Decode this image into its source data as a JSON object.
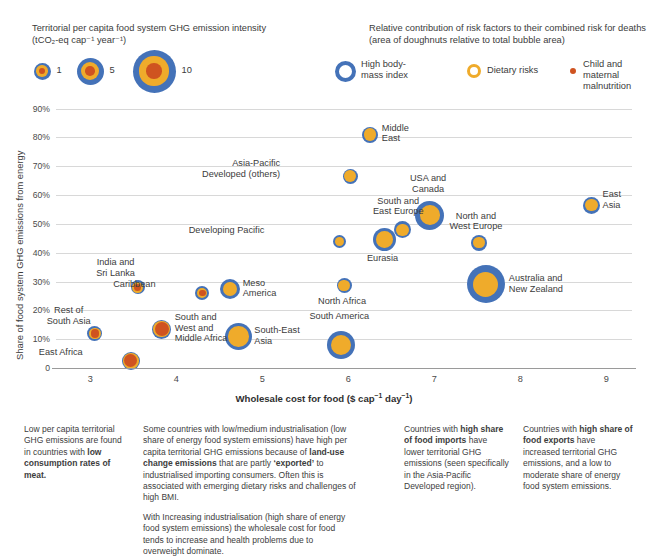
{
  "size_legend": {
    "title_line1": "Territorial per capita food system GHG emission intensity",
    "title_line2": "(tCO₂-eq cap⁻¹ year⁻¹)",
    "items": [
      {
        "label": "1",
        "value": 1
      },
      {
        "label": "5",
        "value": 5
      },
      {
        "label": "10",
        "value": 10
      }
    ]
  },
  "risk_legend": {
    "title_line1": "Relative contribution of risk factors to their combined risk for deaths",
    "title_line2": "(area of doughnuts relative to total bubble area)",
    "items": [
      {
        "label": "High body-mass index",
        "color": "#4472b8"
      },
      {
        "label": "Dietary risks",
        "color": "#efab2b"
      },
      {
        "label": "Child and maternal malnutrition",
        "color": "#cf5320"
      }
    ]
  },
  "chart_data": {
    "type": "scatter",
    "title": "",
    "xlabel": "Wholesale cost for food ($ cap⁻¹ day⁻¹)",
    "ylabel": "Share of food system GHG emissions from energy",
    "xlim": [
      2.6,
      9.3
    ],
    "ylim": [
      0,
      93
    ],
    "xticks": [
      "3",
      "4",
      "5",
      "6",
      "7",
      "8",
      "9"
    ],
    "xtick_values": [
      3,
      4,
      5,
      6,
      7,
      8,
      9
    ],
    "yticks": [
      "0",
      "10%",
      "20%",
      "30%",
      "40%",
      "50%",
      "60%",
      "70%",
      "80%",
      "90%"
    ],
    "ytick_values": [
      0,
      10,
      20,
      30,
      40,
      50,
      60,
      70,
      80,
      90
    ],
    "grid": true,
    "legend_position": "top",
    "colors": {
      "bmi": "#4472b8",
      "dietary": "#efab2b",
      "malnutrition": "#cf5320"
    },
    "points": [
      {
        "name": "Rest of\nSouth Asia",
        "x": 3.05,
        "y": 12.0,
        "r": 7.5,
        "dietary": 0.62,
        "malnutrition": 0.3,
        "label_dx": -26,
        "label_dy": -28,
        "label_align": "center"
      },
      {
        "name": "East Africa",
        "x": 3.47,
        "y": 2.5,
        "r": 9.0,
        "dietary": 0.74,
        "malnutrition": 0.52,
        "label_dx": -48,
        "label_dy": -14,
        "label_align": "right"
      },
      {
        "name": "India and\nSri Lanka",
        "x": 3.55,
        "y": 28.0,
        "r": 7.0,
        "dietary": 0.6,
        "malnutrition": 0.26,
        "label_dx": -22,
        "label_dy": -30,
        "label_align": "center"
      },
      {
        "name": "South and\nWest and\nMiddle Africa",
        "x": 3.83,
        "y": 13.5,
        "r": 9.5,
        "dietary": 0.76,
        "malnutrition": 0.56,
        "label_dx": 13,
        "label_dy": -17,
        "label_align": "left"
      },
      {
        "name": "Caribbean",
        "x": 4.3,
        "y": 26.0,
        "r": 7.0,
        "dietary": 0.58,
        "malnutrition": 0.24,
        "label_dx": -47,
        "label_dy": -14,
        "label_align": "right"
      },
      {
        "name": "Meso\nAmerica",
        "x": 4.62,
        "y": 27.5,
        "r": 10.0,
        "dietary": 0.5,
        "malnutrition": 0.0,
        "label_dx": 13,
        "label_dy": -11,
        "label_align": "left"
      },
      {
        "name": "South-East\nAsia",
        "x": 4.72,
        "y": 11.0,
        "r": 13.5,
        "dietary": 0.58,
        "malnutrition": 0.0,
        "label_dx": 16,
        "label_dy": -11,
        "label_align": "left"
      },
      {
        "name": "South America",
        "x": 5.92,
        "y": 8.0,
        "r": 14.0,
        "dietary": 0.52,
        "malnutrition": 0.0,
        "label_dx": -2,
        "label_dy": -34,
        "label_align": "center"
      },
      {
        "name": "North Africa",
        "x": 5.95,
        "y": 28.5,
        "r": 7.5,
        "dietary": 0.55,
        "malnutrition": 0.0,
        "label_dx": -2,
        "label_dy": 10,
        "label_align": "center"
      },
      {
        "name": "Developing Pacific",
        "x": 5.9,
        "y": 44.0,
        "r": 6.5,
        "dietary": 0.48,
        "malnutrition": 0.0,
        "label_dx": -75,
        "label_dy": -16,
        "label_align": "right"
      },
      {
        "name": "Asia-Pacific\nDeveloped (others)",
        "x": 6.02,
        "y": 66.5,
        "r": 7.5,
        "dietary": 0.62,
        "malnutrition": 0.0,
        "label_dx": -70,
        "label_dy": -18,
        "label_align": "right"
      },
      {
        "name": "Middle\nEast",
        "x": 6.25,
        "y": 81.0,
        "r": 8.0,
        "dietary": 0.58,
        "malnutrition": 0.0,
        "label_dx": 12,
        "label_dy": -12,
        "label_align": "left"
      },
      {
        "name": "Eurasia",
        "x": 6.42,
        "y": 44.5,
        "r": 11.5,
        "dietary": 0.52,
        "malnutrition": 0.0,
        "label_dx": -2,
        "label_dy": 13,
        "label_align": "center"
      },
      {
        "name": "South and\nEast Europe",
        "x": 6.63,
        "y": 48.0,
        "r": 8.5,
        "dietary": 0.52,
        "malnutrition": 0.0,
        "label_dx": -4,
        "label_dy": -34,
        "label_align": "center"
      },
      {
        "name": "USA and\nCanada",
        "x": 6.95,
        "y": 53.0,
        "r": 14.5,
        "dietary": 0.46,
        "malnutrition": 0.0,
        "label_dx": -2,
        "label_dy": -42,
        "label_align": "center"
      },
      {
        "name": "North and\nWest Europe",
        "x": 7.52,
        "y": 43.5,
        "r": 8.0,
        "dietary": 0.52,
        "malnutrition": 0.0,
        "label_dx": -3,
        "label_dy": -32,
        "label_align": "center"
      },
      {
        "name": "Australia and\nNew Zealand",
        "x": 7.6,
        "y": 29.0,
        "r": 19.0,
        "dietary": 0.44,
        "malnutrition": 0.0,
        "label_dx": 23,
        "label_dy": -11,
        "label_align": "left"
      },
      {
        "name": "East\nAsia",
        "x": 8.83,
        "y": 56.5,
        "r": 8.5,
        "dietary": 0.52,
        "malnutrition": 0.0,
        "label_dx": 11,
        "label_dy": -16,
        "label_align": "left"
      }
    ]
  },
  "notes": [
    {
      "id": "note-1",
      "paragraphs": [
        [
          {
            "t": "Low per capita territorial GHG emissions are found in countries with ",
            "b": false
          },
          {
            "t": "low consumption rates of meat.",
            "b": true
          }
        ]
      ]
    },
    {
      "id": "note-2",
      "paragraphs": [
        [
          {
            "t": "Some countries with low/medium industrialisation (low share of energy food system emissions) have high per capita territorial GHG emissions because of ",
            "b": false
          },
          {
            "t": "land-use change emissions",
            "b": true
          },
          {
            "t": " that are partly ",
            "b": false
          },
          {
            "t": "‘exported’",
            "b": true
          },
          {
            "t": " to industrialised importing consumers. Often this is associated with emerging dietary risks and challenges of high BMI.",
            "b": false
          }
        ],
        [
          {
            "t": "With Increasing industrialisation (high share of energy food system emissions) the wholesale cost for food tends to increase and health problems due to overweight dominate.",
            "b": false
          }
        ]
      ]
    },
    {
      "id": "note-3",
      "paragraphs": [
        [
          {
            "t": "Countries with ",
            "b": false
          },
          {
            "t": "high share of food imports",
            "b": true
          },
          {
            "t": " have lower territorial GHG emissions (seen specifically in the Asia-Pacific Developed region).",
            "b": false
          }
        ]
      ]
    },
    {
      "id": "note-4",
      "paragraphs": [
        [
          {
            "t": "Countries with ",
            "b": false
          },
          {
            "t": "high share of food exports",
            "b": true
          },
          {
            "t": " have increased territorial GHG emissions, and a low to moderate share of energy food system emissions.",
            "b": false
          }
        ]
      ]
    }
  ]
}
